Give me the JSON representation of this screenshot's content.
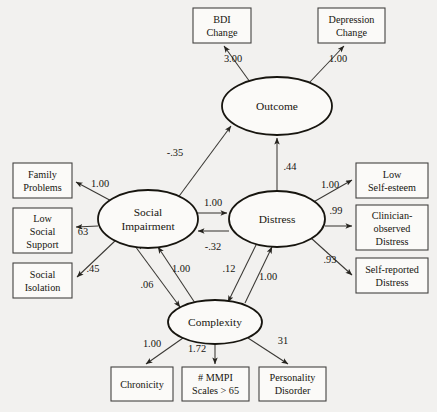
{
  "diagram": {
    "type": "structural-equation-model-path-diagram",
    "latent_variables": [
      {
        "id": "outcome",
        "label": "Outcome",
        "cx": 277,
        "cy": 106,
        "rx": 55,
        "ry": 29
      },
      {
        "id": "social_impairment",
        "label_line1": "Social",
        "label_line2": "Impairment",
        "cx": 148,
        "cy": 219,
        "rx": 50,
        "ry": 29
      },
      {
        "id": "distress",
        "label": "Distress",
        "cx": 277,
        "cy": 219,
        "rx": 48,
        "ry": 28
      },
      {
        "id": "complexity",
        "label": "Complexity",
        "cx": 215,
        "cy": 322,
        "rx": 47,
        "ry": 22
      }
    ],
    "indicators": [
      {
        "id": "bdi_change",
        "lines": [
          "BDI",
          "Change"
        ],
        "x": 193,
        "y": 8,
        "w": 58,
        "h": 35
      },
      {
        "id": "depression_change",
        "lines": [
          "Depression",
          "Change"
        ],
        "x": 318,
        "y": 8,
        "w": 67,
        "h": 35
      },
      {
        "id": "family_problems",
        "lines": [
          "Family",
          "Problems"
        ],
        "x": 13,
        "y": 163,
        "w": 59,
        "h": 35
      },
      {
        "id": "low_social_support",
        "lines": [
          "Low",
          "Social",
          "Support"
        ],
        "x": 13,
        "y": 208,
        "w": 59,
        "h": 45
      },
      {
        "id": "social_isolation",
        "lines": [
          "Social",
          "Isolation"
        ],
        "x": 13,
        "y": 263,
        "w": 59,
        "h": 35
      },
      {
        "id": "low_self_esteem",
        "lines": [
          "Low",
          "Self-esteem"
        ],
        "x": 356,
        "y": 163,
        "w": 72,
        "h": 35
      },
      {
        "id": "clinician_observed_distress",
        "lines": [
          "Clinician-",
          "observed",
          "Distress"
        ],
        "x": 356,
        "y": 205,
        "w": 72,
        "h": 45
      },
      {
        "id": "self_reported_distress",
        "lines": [
          "Self-reported",
          "Distress"
        ],
        "x": 356,
        "y": 258,
        "w": 72,
        "h": 35
      },
      {
        "id": "chronicity",
        "lines": [
          "Chronicity"
        ],
        "x": 111,
        "y": 367,
        "w": 62,
        "h": 34
      },
      {
        "id": "mmpi_scales",
        "lines": [
          "# MMPI",
          "Scales > 65"
        ],
        "x": 182,
        "y": 367,
        "w": 67,
        "h": 34
      },
      {
        "id": "personality_disorder",
        "lines": [
          "Personality",
          "Disorder"
        ],
        "x": 259,
        "y": 367,
        "w": 67,
        "h": 34
      }
    ],
    "coefficients": [
      {
        "id": "outcome-to-bdi-change",
        "value": "3.00",
        "x": 233,
        "y": 62
      },
      {
        "id": "outcome-to-depression-change",
        "value": "1.00",
        "x": 338,
        "y": 62
      },
      {
        "id": "social-impairment-to-outcome",
        "value": "-.35",
        "x": 175,
        "y": 156
      },
      {
        "id": "distress-to-outcome",
        "value": ".44",
        "x": 290,
        "y": 170
      },
      {
        "id": "social-impairment-to-family-problems",
        "value": "1.00",
        "x": 100,
        "y": 187
      },
      {
        "id": "social-impairment-to-low-social-support",
        "value": "63",
        "x": 83,
        "y": 235
      },
      {
        "id": "social-impairment-to-social-isolation",
        "value": ".45",
        "x": 93,
        "y": 272
      },
      {
        "id": "social-impairment-to-distress",
        "value": "1.00",
        "x": 213,
        "y": 206
      },
      {
        "id": "distress-to-social-impairment",
        "value": "-.32",
        "x": 213,
        "y": 250
      },
      {
        "id": "social-impairment-to-complexity",
        "value": ".06",
        "x": 147,
        "y": 288
      },
      {
        "id": "complexity-to-social-impairment",
        "value": "1.00",
        "x": 181,
        "y": 272
      },
      {
        "id": "distress-to-complexity",
        "value": ".12",
        "x": 229,
        "y": 272
      },
      {
        "id": "complexity-to-distress",
        "value": "1.00",
        "x": 268,
        "y": 280
      },
      {
        "id": "distress-to-low-self-esteem",
        "value": "1.00",
        "x": 330,
        "y": 188
      },
      {
        "id": "distress-to-clinician-observed-distress",
        "value": ".99",
        "x": 336,
        "y": 214
      },
      {
        "id": "distress-to-self-reported-distress",
        "value": ".93",
        "x": 330,
        "y": 263
      },
      {
        "id": "complexity-to-chronicity",
        "value": "1.00",
        "x": 152,
        "y": 347
      },
      {
        "id": "complexity-to-mmpi-scales",
        "value": "1.72",
        "x": 197,
        "y": 352
      },
      {
        "id": "complexity-to-personality-disorder",
        "value": "31",
        "x": 283,
        "y": 344
      }
    ]
  }
}
